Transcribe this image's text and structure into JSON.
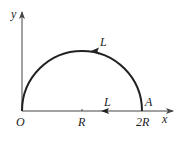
{
  "diagram": {
    "type": "semicircular-path",
    "axes": {
      "x_label": "x",
      "y_label": "y",
      "origin_label": "O"
    },
    "ticks": [
      {
        "label": "R",
        "value": "R"
      },
      {
        "label": "2R",
        "value": "2R"
      }
    ],
    "points": [
      {
        "name": "O",
        "label": "O"
      },
      {
        "name": "A",
        "label": "A"
      }
    ],
    "paths": [
      {
        "name": "arc",
        "label": "L",
        "direction": "counterclockwise (A to O over top)"
      },
      {
        "name": "diameter",
        "label": "L",
        "direction": "left along x-axis"
      }
    ],
    "colors": {
      "stroke": "#222222",
      "axis": "#444444",
      "background": "#ffffff"
    }
  }
}
